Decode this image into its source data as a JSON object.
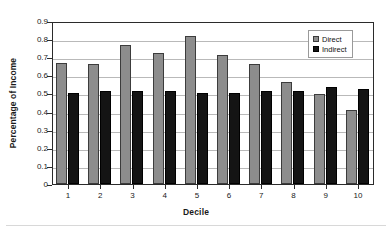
{
  "chart_data": {
    "type": "bar",
    "title": "",
    "xlabel": "Decile",
    "ylabel": "Percentage of Income",
    "categories": [
      "1",
      "2",
      "3",
      "4",
      "5",
      "6",
      "7",
      "8",
      "9",
      "10"
    ],
    "series": [
      {
        "name": "Direct",
        "color": "#8d8d8d",
        "values": [
          0.67,
          0.66,
          0.765,
          0.725,
          0.815,
          0.715,
          0.665,
          0.565,
          0.495,
          0.41
        ]
      },
      {
        "name": "Indirect",
        "color": "#141414",
        "values": [
          0.505,
          0.515,
          0.515,
          0.515,
          0.505,
          0.505,
          0.515,
          0.515,
          0.535,
          0.525
        ]
      }
    ],
    "ylim": [
      0,
      0.9
    ],
    "yticks": [
      "0",
      "0.1",
      "0.2",
      "0.3",
      "0.4",
      "0.5",
      "0.6",
      "0.7",
      "0.8",
      "0.9"
    ],
    "ytick_values": [
      0,
      0.1,
      0.2,
      0.3,
      0.4,
      0.5,
      0.6,
      0.7,
      0.8,
      0.9
    ],
    "grid": true,
    "grid_axis": "y",
    "legend_position": "top-right"
  }
}
